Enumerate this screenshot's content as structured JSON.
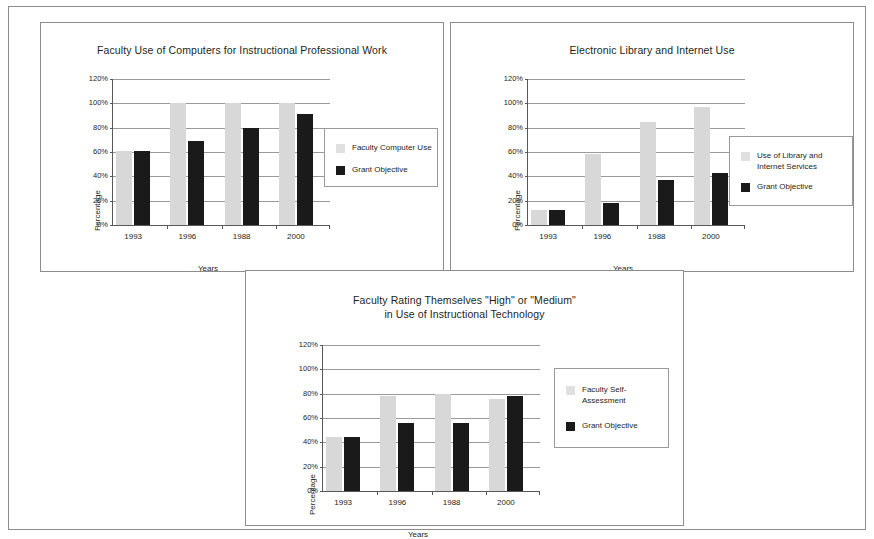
{
  "page": {
    "background_color": "#ffffff",
    "border_color": "#8d8d8d"
  },
  "colors": {
    "light_series": "#d8d8d8",
    "dark_series": "#1a1a1a",
    "gridline": "#9a9a9c",
    "axis": "#58585a",
    "text": "#231f20"
  },
  "charts": [
    {
      "id": "chart-faculty-computer-use",
      "chart_data": {
        "type": "bar",
        "title": "Faculty Use of Computers for Instructional Professional Work",
        "xlabel": "Years",
        "ylabel": "Percentage",
        "categories": [
          "1993",
          "1996",
          "1988",
          "2000"
        ],
        "ylim": [
          0,
          120
        ],
        "yticks": [
          0,
          20,
          40,
          60,
          80,
          100,
          120
        ],
        "ytick_labels": [
          "0%",
          "20%",
          "40%",
          "60%",
          "80%",
          "100%",
          "120%"
        ],
        "grid": true,
        "legend_position": "right",
        "series": [
          {
            "name": "Faculty Computer Use",
            "color": "#d8d8d8",
            "values": [
              61,
              100,
              100,
              100
            ]
          },
          {
            "name": "Grant Objective",
            "color": "#1a1a1a",
            "values": [
              61,
              69,
              80,
              91
            ]
          }
        ]
      }
    },
    {
      "id": "chart-electronic-library-internet-use",
      "chart_data": {
        "type": "bar",
        "title": "Electronic Library and Internet Use",
        "xlabel": "Years",
        "ylabel": "Percentage",
        "categories": [
          "1993",
          "1996",
          "1988",
          "2000"
        ],
        "ylim": [
          0,
          120
        ],
        "yticks": [
          0,
          20,
          40,
          60,
          80,
          100,
          120
        ],
        "ytick_labels": [
          "0%",
          "20%",
          "40%",
          "60%",
          "80%",
          "100%",
          "120%"
        ],
        "grid": true,
        "legend_position": "right",
        "series": [
          {
            "name": "Use of Library and\nInternet Services",
            "color": "#d8d8d8",
            "values": [
              12,
              58,
              85,
              97
            ]
          },
          {
            "name": "Grant Objective",
            "color": "#1a1a1a",
            "values": [
              12,
              18,
              37,
              43
            ]
          }
        ]
      }
    },
    {
      "id": "chart-faculty-self-rating",
      "chart_data": {
        "type": "bar",
        "title": "Faculty Rating Themselves \"High\" or \"Medium\"\nin Use of Instructional Technology",
        "xlabel": "Years",
        "ylabel": "Percentage",
        "categories": [
          "1993",
          "1996",
          "1988",
          "2000"
        ],
        "ylim": [
          0,
          120
        ],
        "yticks": [
          0,
          20,
          40,
          60,
          80,
          100,
          120
        ],
        "ytick_labels": [
          "0%",
          "20%",
          "40%",
          "60%",
          "80%",
          "100%",
          "120%"
        ],
        "grid": true,
        "legend_position": "right",
        "series": [
          {
            "name": "Faculty Self-\nAssessment",
            "color": "#d8d8d8",
            "values": [
              44,
              78,
              80,
              76
            ]
          },
          {
            "name": "Grant Objective",
            "color": "#1a1a1a",
            "values": [
              44,
              56,
              56,
              78
            ]
          }
        ]
      }
    }
  ]
}
